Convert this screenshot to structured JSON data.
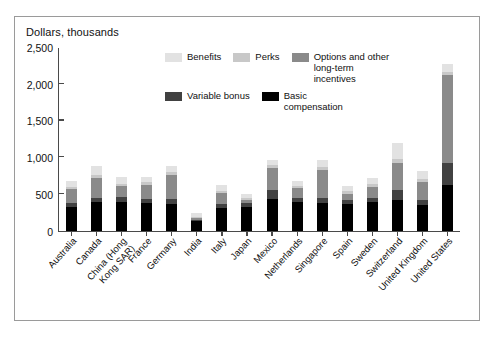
{
  "figure": {
    "title": "Dollars, thousands",
    "frame_color": "#9a9a9a",
    "axis_color": "#4a4a4a"
  },
  "legend": {
    "row1": [
      {
        "label": "Benefits",
        "color": "#e2e2e2"
      },
      {
        "label": "Perks",
        "color": "#c8c8c8"
      },
      {
        "label": "Options and other\nlong-term incentives",
        "color": "#8a8a8a"
      }
    ],
    "row2": [
      {
        "label": "Variable bonus",
        "color": "#414141"
      },
      {
        "label": "Basic\ncompensation",
        "color": "#000000"
      }
    ]
  },
  "chart_data": {
    "type": "bar",
    "stacked": true,
    "title": "Dollars, thousands",
    "xlabel": "",
    "ylabel": "Dollars, thousands",
    "ylim": [
      0,
      2500
    ],
    "yticks": [
      "0",
      "500",
      "1,000",
      "1,500",
      "2,000",
      "2,500"
    ],
    "ytick_values": [
      0,
      500,
      1000,
      1500,
      2000,
      2500
    ],
    "grid": false,
    "legend_position": "inside-top-center",
    "categories": [
      "Australia",
      "Canada",
      "China (Hong\nKong SAR)",
      "France",
      "Germany",
      "India",
      "Italy",
      "Japan",
      "Mexico",
      "Netherlands",
      "Singapore",
      "Spain",
      "Sweden",
      "Switzerland",
      "United Kingdom",
      "United States"
    ],
    "series": [
      {
        "name": "Basic compensation",
        "color": "#000000",
        "values": [
          330,
          390,
          400,
          380,
          370,
          140,
          310,
          330,
          430,
          390,
          380,
          370,
          390,
          420,
          360,
          620
        ]
      },
      {
        "name": "Variable bonus",
        "color": "#414141",
        "values": [
          55,
          60,
          60,
          50,
          60,
          15,
          55,
          50,
          130,
          60,
          70,
          50,
          60,
          140,
          60,
          300
        ]
      },
      {
        "name": "Options and other long-term incentives",
        "color": "#8a8a8a",
        "values": [
          180,
          270,
          150,
          200,
          330,
          20,
          145,
          40,
          300,
          130,
          380,
          90,
          150,
          360,
          250,
          1200
        ]
      },
      {
        "name": "Perks",
        "color": "#c8c8c8",
        "values": [
          40,
          45,
          35,
          35,
          40,
          15,
          35,
          25,
          40,
          35,
          40,
          35,
          40,
          60,
          40,
          40
        ]
      },
      {
        "name": "Benefits",
        "color": "#e2e2e2",
        "values": [
          75,
          120,
          90,
          65,
          80,
          50,
          75,
          60,
          70,
          65,
          90,
          65,
          80,
          220,
          110,
          110
        ]
      }
    ],
    "totals": [
      680,
      885,
      735,
      730,
      880,
      240,
      620,
      505,
      970,
      680,
      960,
      610,
      720,
      1200,
      820,
      2270
    ]
  }
}
